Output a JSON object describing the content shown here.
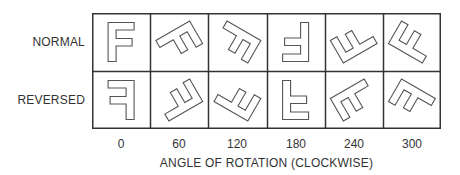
{
  "rows": [
    {
      "label": "NORMAL",
      "mirrored": false
    },
    {
      "label": "REVERSED",
      "mirrored": true
    }
  ],
  "columns": [
    {
      "angle": 0,
      "label": "0"
    },
    {
      "angle": 60,
      "label": "60"
    },
    {
      "angle": 120,
      "label": "120"
    },
    {
      "angle": 180,
      "label": "180"
    },
    {
      "angle": 240,
      "label": "240"
    },
    {
      "angle": 300,
      "label": "300"
    }
  ],
  "axis_title": "ANGLE OF ROTATION (CLOCKWISE)",
  "glyph": "F",
  "colors": {
    "grid_line": "#333333",
    "glyph_stroke": "#555555",
    "glyph_fill": "#ffffff",
    "text": "#333333"
  }
}
